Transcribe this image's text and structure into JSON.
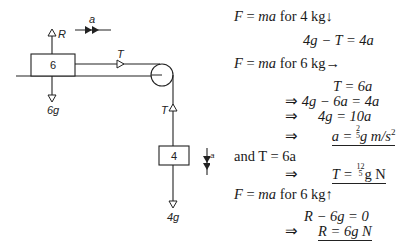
{
  "diagram": {
    "block_6": {
      "label": "6"
    },
    "block_4": {
      "label": "4"
    },
    "labels": {
      "R": "R",
      "a_horizontal": "a",
      "T_horizontal": "T",
      "T_vertical": "T",
      "weight_6": "6g",
      "weight_4": "4g",
      "a_vertical": "a"
    }
  },
  "solution": {
    "lines": [
      {
        "id": "l1",
        "text_parts": [
          "F",
          " = ",
          "ma",
          " for 4 kg↓"
        ]
      },
      {
        "id": "l2",
        "text": "4g − T = 4a"
      },
      {
        "id": "l3",
        "text_parts": [
          "F",
          " = ",
          "ma",
          " for 6 kg→"
        ]
      },
      {
        "id": "l4",
        "text": "T = 6a"
      },
      {
        "id": "l5",
        "prefix": "⇒",
        "text": "4g − 6a = 4a"
      },
      {
        "id": "l6",
        "prefix": "⇒",
        "text": "4g = 10a"
      },
      {
        "id": "l7",
        "prefix": "⇒",
        "lhs": "a = ",
        "frac_num": "2",
        "frac_den": "5",
        "rhs": "g m/s",
        "sup": "2"
      },
      {
        "id": "l8",
        "text": "and T = 6a"
      },
      {
        "id": "l9",
        "prefix": "⇒",
        "lhs": "T = ",
        "frac_num": "12",
        "frac_den": "5",
        "rhs": "g N"
      },
      {
        "id": "l10",
        "text_parts": [
          "F",
          " = ",
          "ma",
          " for 6 kg↑"
        ]
      },
      {
        "id": "l11",
        "text": "R − 6g = 0"
      },
      {
        "id": "l12",
        "prefix": "⇒",
        "text": "R = 6g N"
      }
    ]
  }
}
